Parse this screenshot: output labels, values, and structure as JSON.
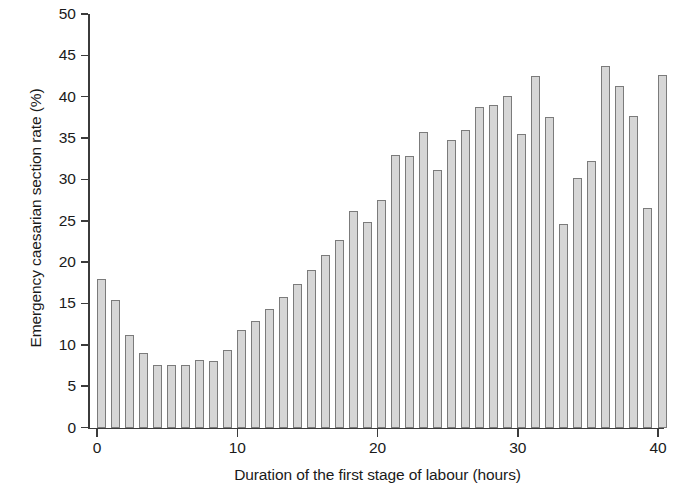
{
  "chart_data": {
    "type": "bar",
    "title": "",
    "xlabel": "Duration of the first stage of labour (hours)",
    "ylabel": "Emergency caesarian section rate (%)",
    "xlim": [
      0,
      40
    ],
    "ylim": [
      0,
      50
    ],
    "xticks": [
      0,
      10,
      20,
      30,
      40
    ],
    "yticks": [
      0,
      5,
      10,
      15,
      20,
      25,
      30,
      35,
      40,
      45,
      50
    ],
    "grid": false,
    "legend": null,
    "bar_fill_color": "#d6d6d6",
    "bar_edge_color": "#7b7b7b",
    "axis_color": "#3b3b3b",
    "categories": [
      0,
      1,
      2,
      3,
      4,
      5,
      6,
      7,
      8,
      9,
      10,
      11,
      12,
      13,
      14,
      15,
      16,
      17,
      18,
      19,
      20,
      21,
      22,
      23,
      24,
      25,
      26,
      27,
      28,
      29,
      30,
      31,
      32,
      33,
      34,
      35,
      36,
      37,
      38,
      39,
      40
    ],
    "values": [
      18.0,
      15.4,
      11.2,
      9.0,
      7.6,
      7.6,
      7.5,
      8.2,
      8.1,
      9.4,
      11.8,
      12.9,
      14.3,
      15.8,
      17.3,
      19.1,
      20.9,
      22.7,
      26.2,
      24.9,
      27.5,
      33.0,
      32.8,
      35.7,
      31.1,
      34.8,
      36.0,
      38.8,
      39.0,
      40.1,
      35.5,
      42.5,
      37.6,
      24.6,
      30.2,
      32.2,
      43.7,
      41.3,
      37.7,
      26.6,
      42.6
    ]
  },
  "axis": {
    "ylabel_text": "Emergency caesarian section rate (%)",
    "xlabel_text": "Duration of the first stage of labour (hours)"
  }
}
